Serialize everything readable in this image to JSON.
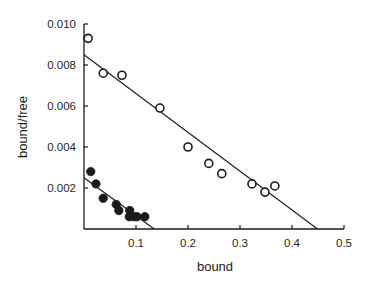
{
  "chart_data": {
    "type": "scatter",
    "title": "",
    "xlabel": "bound",
    "ylabel": "bound/free",
    "xlim": [
      0,
      0.5
    ],
    "ylim": [
      0,
      0.01
    ],
    "xticks": [
      0.1,
      0.2,
      0.3,
      0.4,
      0.5
    ],
    "xtick_labels": [
      "0.1",
      "0.2",
      "0.3",
      "0.4",
      "0.5"
    ],
    "yticks": [
      0.002,
      0.004,
      0.006,
      0.008,
      0.01
    ],
    "ytick_labels": [
      "0.002",
      "0.004",
      "0.006",
      "0.008",
      "0.010"
    ],
    "grid": false,
    "legend": null,
    "series": [
      {
        "name": "open circles",
        "marker": "open-circle",
        "points": [
          {
            "x": 0.008,
            "y": 0.0093
          },
          {
            "x": 0.037,
            "y": 0.0076
          },
          {
            "x": 0.073,
            "y": 0.0075
          },
          {
            "x": 0.146,
            "y": 0.0059
          },
          {
            "x": 0.2,
            "y": 0.004
          },
          {
            "x": 0.24,
            "y": 0.0032
          },
          {
            "x": 0.265,
            "y": 0.0027
          },
          {
            "x": 0.323,
            "y": 0.0022
          },
          {
            "x": 0.348,
            "y": 0.0018
          },
          {
            "x": 0.367,
            "y": 0.0021
          }
        ],
        "fit_line": {
          "x0": 0,
          "y0": 0.0085,
          "x1": 0.449,
          "y1": 0
        }
      },
      {
        "name": "filled circles",
        "marker": "filled-circle",
        "points": [
          {
            "x": 0.013,
            "y": 0.0028
          },
          {
            "x": 0.023,
            "y": 0.0022
          },
          {
            "x": 0.037,
            "y": 0.0015
          },
          {
            "x": 0.062,
            "y": 0.0012
          },
          {
            "x": 0.067,
            "y": 0.0009
          },
          {
            "x": 0.088,
            "y": 0.0009
          },
          {
            "x": 0.087,
            "y": 0.0006
          },
          {
            "x": 0.096,
            "y": 0.0006
          },
          {
            "x": 0.102,
            "y": 0.0006
          },
          {
            "x": 0.117,
            "y": 0.0006
          }
        ],
        "fit_line": {
          "x0": 0,
          "y0": 0.0025,
          "x1": 0.135,
          "y1": 0
        }
      }
    ]
  },
  "style": {
    "ink": "#1a1a1a",
    "background": "#ffffff"
  }
}
